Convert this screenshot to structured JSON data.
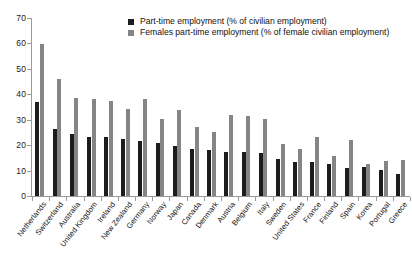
{
  "chart_data": {
    "type": "bar",
    "title": "",
    "subtitle": "",
    "xlabel": "",
    "ylabel": "",
    "ylim": [
      0,
      70
    ],
    "yticks": [
      0,
      10,
      20,
      30,
      40,
      50,
      60,
      70
    ],
    "ytick_labels": [
      "0",
      "10",
      "20",
      "30",
      "40",
      "50",
      "60",
      "70"
    ],
    "grid": false,
    "legend_position": "top-center",
    "categories": [
      "Netherlands",
      "Switzerland",
      "Australia",
      "United Kingdom",
      "Ireland",
      "New Zealand",
      "Germany",
      "Norway",
      "Japan",
      "Canada",
      "Denmark",
      "Austria",
      "Belgium",
      "Italy",
      "Sweden",
      "United States",
      "France",
      "Finland",
      "Spain",
      "Korea",
      "Portugal",
      "Greece"
    ],
    "series": [
      {
        "name": "Part-time employment (% of civilian employment)",
        "color": "#1c1c1c",
        "values": [
          37.0,
          26.3,
          24.3,
          23.2,
          23.2,
          22.4,
          21.8,
          21.0,
          19.6,
          18.5,
          18.0,
          17.3,
          17.2,
          16.8,
          14.4,
          13.3,
          13.2,
          12.4,
          11.2,
          11.3,
          10.2,
          8.8
        ]
      },
      {
        "name": "Females part-time employment (% of female civilian employment)",
        "color": "#858585",
        "values": [
          59.9,
          45.9,
          38.4,
          38.3,
          37.5,
          34.3,
          38.1,
          30.1,
          33.8,
          27.3,
          25.0,
          31.8,
          31.5,
          30.3,
          20.6,
          18.3,
          23.4,
          15.8,
          21.9,
          12.7,
          13.8,
          14.2
        ]
      }
    ],
    "legend": [
      {
        "label": "Part-time employment (% of civilian employment)",
        "swatch": "dark",
        "clipped": false
      },
      {
        "label": "Females part-time employment (% of female civilian employment)",
        "swatch": "light",
        "clipped": true
      }
    ]
  }
}
